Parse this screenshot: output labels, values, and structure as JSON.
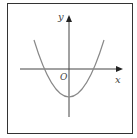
{
  "diagram": {
    "type": "function-graph",
    "axes": {
      "x_label": "x",
      "y_label": "y",
      "origin_label": "O"
    },
    "curve": {
      "kind": "parabola",
      "opens": "up",
      "vertex_position": "on negative y-axis",
      "x_intercepts": "two, symmetric about y-axis"
    },
    "colors": {
      "frame": "#333333",
      "axes": "#444444",
      "curve": "#888888",
      "background": "#ffffff"
    }
  }
}
